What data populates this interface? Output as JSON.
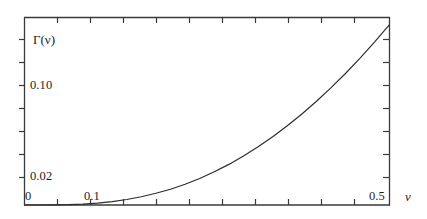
{
  "chart_data": {
    "type": "line",
    "title": "",
    "subtitle": "",
    "xlabel": "ν",
    "ylabel": "Γ(ν)",
    "ylabel_display": "Γ(ν)",
    "grid": false,
    "legend": null,
    "xlim": [
      0,
      0.5
    ],
    "ylim": [
      0,
      0.1588
    ],
    "x_ticks_labeled": [
      {
        "value": 0,
        "label": "0"
      },
      {
        "value": 0.1,
        "label": "0.1"
      },
      {
        "value": 0.5,
        "label": "0.5"
      }
    ],
    "y_ticks_labeled": [
      {
        "value": 0.02,
        "label": "0.02"
      },
      {
        "value": 0.1,
        "label": "0.10"
      }
    ],
    "x_tick_step_minor": 0.025,
    "y_tick_step_minor": 0.02,
    "series": [
      {
        "name": "Γ(ν)",
        "color": "#2b2b2b",
        "x": [
          0.0,
          0.02,
          0.04,
          0.06,
          0.08,
          0.1,
          0.12,
          0.14,
          0.16,
          0.18,
          0.2,
          0.22,
          0.24,
          0.26,
          0.28,
          0.3,
          0.32,
          0.34,
          0.36,
          0.38,
          0.4,
          0.42,
          0.44,
          0.46,
          0.48,
          0.5
        ],
        "y": [
          0.0,
          0.0,
          0.0001,
          0.0003,
          0.0008,
          0.0016,
          0.0029,
          0.0047,
          0.007,
          0.0099,
          0.0134,
          0.0176,
          0.0225,
          0.0281,
          0.0344,
          0.0415,
          0.0493,
          0.0578,
          0.0671,
          0.0771,
          0.0879,
          0.0994,
          0.1116,
          0.1246,
          0.1383,
          0.1527
        ]
      }
    ],
    "annotations": []
  },
  "labels": {
    "y_axis_title": "Γ(ν)",
    "y_tick_010": "0.10",
    "y_tick_002": "0.02",
    "x_tick_0": "0",
    "x_tick_01": "0.1",
    "x_tick_05": "0.5",
    "x_axis_title": "ν"
  },
  "style": {
    "background": "#ffffff",
    "frame_color": "#3a3a3a",
    "curve_color": "#2b2b2b",
    "text_color": "#1d1d1d"
  }
}
